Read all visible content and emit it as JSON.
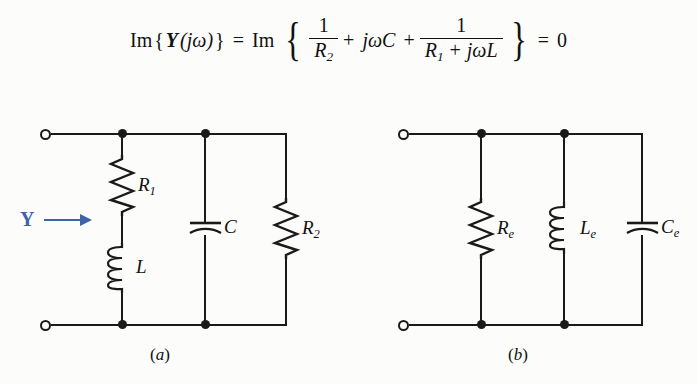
{
  "figure": {
    "background_color": "#fcfcfa",
    "line_color": "#1a1a1a",
    "accent_color": "#3f63a8"
  },
  "equation": {
    "lhs_im": "Im",
    "lhs_open": "{",
    "lhs_admittance": "Y",
    "lhs_arg": "(jω)",
    "lhs_close": "}",
    "equals": "=",
    "rhs_im": "Im",
    "brace_open": "{",
    "term1_num": "1",
    "term1_den_sym": "R",
    "term1_den_sub": "2",
    "plus1": "+",
    "term2": "jωC",
    "plus2": "+",
    "term3_num": "1",
    "term3_den_sym1": "R",
    "term3_den_sub1": "1",
    "term3_den_plus": "+",
    "term3_den_sym2": "jωL",
    "brace_close": "}",
    "equals2": "=",
    "result": "0",
    "plain_text": "Im{Y(jω)} = Im { 1/R₂ + jωC + 1/(R₁ + jωL) } = 0"
  },
  "circuit_a": {
    "caption_open": "(",
    "caption_letter": "a",
    "caption_close": ")",
    "caption": "(a)",
    "annotation": {
      "label": "Y",
      "icon": "right-arrow-icon",
      "color": "#3f63a8"
    },
    "components": [
      {
        "id": "R1",
        "type": "resistor",
        "sym": "R",
        "sub": "1",
        "label": "R₁"
      },
      {
        "id": "L",
        "type": "inductor",
        "sym": "L",
        "sub": "",
        "label": "L"
      },
      {
        "id": "C",
        "type": "capacitor",
        "sym": "C",
        "sub": "",
        "label": "C"
      },
      {
        "id": "R2",
        "type": "resistor",
        "sym": "R",
        "sub": "2",
        "label": "R₂"
      }
    ],
    "terminals": [
      "top-left-terminal",
      "bottom-left-terminal"
    ]
  },
  "circuit_b": {
    "caption_open": "(",
    "caption_letter": "b",
    "caption_close": ")",
    "caption": "(b)",
    "components": [
      {
        "id": "Re",
        "type": "resistor",
        "sym": "R",
        "sub": "e",
        "label": "Rₑ"
      },
      {
        "id": "Le",
        "type": "inductor",
        "sym": "L",
        "sub": "e",
        "label": "Lₑ"
      },
      {
        "id": "Ce",
        "type": "capacitor",
        "sym": "C",
        "sub": "e",
        "label": "Cₑ"
      }
    ],
    "terminals": [
      "top-left-terminal",
      "bottom-left-terminal"
    ]
  }
}
